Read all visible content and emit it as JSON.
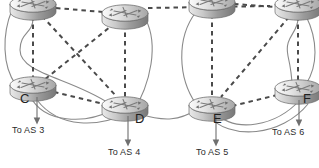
{
  "diagram": {
    "type": "network-topology",
    "colors": {
      "background": "#ffffff",
      "router_body_light": "#f2f2f2",
      "router_body_mid": "#bdbdbd",
      "router_body_dark": "#8d8d8d",
      "router_outline": "#6e6e6e",
      "link_solid": "#8a8a8a",
      "link_dashed": "#4a4a4a",
      "arrow": "#6f6f6f",
      "text": "#2b2b2b"
    },
    "legend_note": "Dashed lines denote iBGP peering sessions; solid curved lines denote physical links."
  },
  "routers": [
    {
      "id": "r-topleft",
      "label": "",
      "label_visible": false,
      "x": 33,
      "y": 6,
      "as": "left",
      "clipped_top": true
    },
    {
      "id": "r-g",
      "label": "G",
      "label_visible": true,
      "x": 125,
      "y": 13,
      "as": "left",
      "clipped_top": false
    },
    {
      "id": "r-c",
      "label": "C",
      "label_visible": true,
      "x": 33,
      "y": 85,
      "as": "left",
      "clipped_top": false
    },
    {
      "id": "r-d",
      "label": "D",
      "label_visible": true,
      "x": 125,
      "y": 105,
      "as": "left",
      "clipped_top": false
    },
    {
      "id": "r-topright",
      "label": "",
      "label_visible": false,
      "x": 212,
      "y": 4,
      "as": "right",
      "clipped_top": true
    },
    {
      "id": "r-topright2",
      "label": "",
      "label_visible": false,
      "x": 298,
      "y": 6,
      "as": "right",
      "clipped_top": true
    },
    {
      "id": "r-e",
      "label": "E",
      "label_visible": true,
      "x": 212,
      "y": 105,
      "as": "right",
      "clipped_top": false
    },
    {
      "id": "r-f",
      "label": "F",
      "label_visible": true,
      "x": 298,
      "y": 88,
      "as": "right",
      "clipped_top": false
    }
  ],
  "router_labels": [
    {
      "name": "router-label-c",
      "text": "C",
      "x": 20,
      "y": 98
    },
    {
      "name": "router-label-d",
      "text": "D",
      "x": 135,
      "y": 118
    },
    {
      "name": "router-label-e",
      "text": "E",
      "x": 213,
      "y": 118
    },
    {
      "name": "router-label-f",
      "text": "F",
      "x": 303,
      "y": 98
    }
  ],
  "as_links": [
    {
      "name": "to-as-3",
      "text": "To AS 3",
      "x": 12,
      "y": 128,
      "arrow_x": 37,
      "arrow_y0": 97,
      "arrow_y1": 122
    },
    {
      "name": "to-as-4",
      "text": "To AS 4",
      "x": 108,
      "y": 150,
      "arrow_x": 128,
      "arrow_y0": 116,
      "arrow_y1": 144
    },
    {
      "name": "to-as-5",
      "text": "To AS 5",
      "x": 196,
      "y": 150,
      "arrow_x": 216,
      "arrow_y0": 116,
      "arrow_y1": 144
    },
    {
      "name": "to-as-6",
      "text": "To AS 6",
      "x": 272,
      "y": 130,
      "arrow_x": 299,
      "arrow_y0": 100,
      "arrow_y1": 124
    }
  ],
  "ibgp_sessions": [
    {
      "from": "r-topleft",
      "to": "r-g"
    },
    {
      "from": "r-topleft",
      "to": "r-c"
    },
    {
      "from": "r-topleft",
      "to": "r-d"
    },
    {
      "from": "r-g",
      "to": "r-c"
    },
    {
      "from": "r-g",
      "to": "r-d"
    },
    {
      "from": "r-c",
      "to": "r-d"
    },
    {
      "from": "r-topright",
      "to": "r-topright2"
    },
    {
      "from": "r-topright",
      "to": "r-e"
    },
    {
      "from": "r-topright",
      "to": "r-f"
    },
    {
      "from": "r-topright2",
      "to": "r-e"
    },
    {
      "from": "r-topright2",
      "to": "r-f"
    },
    {
      "from": "r-e",
      "to": "r-f"
    }
  ],
  "ebgp_session": {
    "from": "r-g",
    "to": "r-topright"
  },
  "physical_links": [
    {
      "from": "r-topleft",
      "to": "r-c"
    },
    {
      "from": "r-topleft",
      "to": "r-d"
    },
    {
      "from": "r-g",
      "to": "r-d"
    },
    {
      "from": "r-c",
      "to": "r-d"
    },
    {
      "from": "r-d",
      "to": "r-e"
    },
    {
      "from": "r-topright",
      "to": "r-e"
    },
    {
      "from": "r-topright2",
      "to": "r-f"
    },
    {
      "from": "r-e",
      "to": "r-f"
    }
  ]
}
